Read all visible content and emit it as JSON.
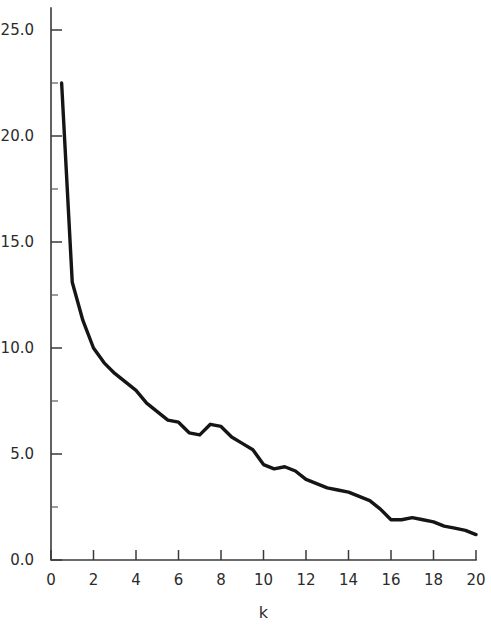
{
  "chart_data": {
    "type": "line",
    "title": "",
    "subtitle": "",
    "xlabel": "k",
    "ylabel": "",
    "xlim": [
      0,
      20
    ],
    "ylim": [
      0.0,
      25.0
    ],
    "grid": false,
    "legend": null,
    "x_ticks": [
      0,
      2,
      4,
      6,
      8,
      10,
      12,
      14,
      16,
      18,
      20
    ],
    "x_tick_labels": [
      "0",
      "2",
      "4",
      "6",
      "8",
      "10",
      "12",
      "14",
      "16",
      "18",
      "20"
    ],
    "x_minor_ticks": [
      1,
      3,
      5,
      7,
      9,
      11,
      13,
      15,
      17,
      19
    ],
    "y_ticks": [
      0.0,
      5.0,
      10.0,
      15.0,
      20.0,
      25.0
    ],
    "y_tick_labels": [
      "0.0",
      "5.0",
      "10.0",
      "15.0",
      "20.0",
      "25.0"
    ],
    "y_minor_ticks": [
      2.5,
      7.5,
      12.5,
      17.5,
      22.5
    ],
    "series": [
      {
        "name": "eigenvalue",
        "color": "#151515",
        "x": [
          0.5,
          1.0,
          1.5,
          2.0,
          2.5,
          3.0,
          3.5,
          4.0,
          4.5,
          5.0,
          5.5,
          6.0,
          6.5,
          7.0,
          7.5,
          8.0,
          8.5,
          9.0,
          9.5,
          10.0,
          10.5,
          11.0,
          11.5,
          12.0,
          12.5,
          13.0,
          13.5,
          14.0,
          14.5,
          15.0,
          15.5,
          16.0,
          16.5,
          17.0,
          17.5,
          18.0,
          18.5,
          19.0,
          19.5,
          20.0
        ],
        "values": [
          22.5,
          13.1,
          11.3,
          10.0,
          9.3,
          8.8,
          8.4,
          8.0,
          7.4,
          7.0,
          6.6,
          6.5,
          6.0,
          5.9,
          6.4,
          6.3,
          5.8,
          5.5,
          5.2,
          4.5,
          4.3,
          4.4,
          4.2,
          3.8,
          3.6,
          3.4,
          3.3,
          3.2,
          3.0,
          2.8,
          2.4,
          1.9,
          1.9,
          2.0,
          1.9,
          1.8,
          1.6,
          1.5,
          1.4,
          1.2
        ]
      }
    ]
  },
  "axes": {
    "x_axis_label": "k",
    "y_axis_label": ""
  }
}
